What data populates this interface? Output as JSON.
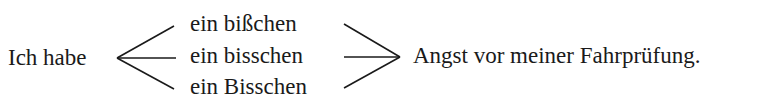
{
  "left": {
    "text": "Ich habe"
  },
  "options": [
    {
      "text": "ein bißchen"
    },
    {
      "text": "ein bisschen"
    },
    {
      "text": "ein Bisschen"
    }
  ],
  "right": {
    "text": "Angst vor meiner Fahrprüfung."
  },
  "colors": {
    "ink": "#1a1a1a",
    "background": "#ffffff"
  }
}
